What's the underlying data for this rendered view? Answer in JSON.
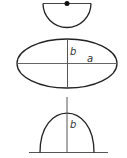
{
  "diagram": {
    "shapes": [
      {
        "name": "semicircle",
        "description": "half circle with diameter line and center point"
      },
      {
        "name": "ellipse",
        "labels": {
          "semi_minor": "b",
          "semi_major": "a"
        }
      },
      {
        "name": "parabolic-arch",
        "labels": {
          "height": "b"
        }
      }
    ],
    "colors": {
      "stroke": "#222222",
      "axis": "#555555",
      "background": "#ffffff"
    }
  },
  "labels": {
    "ellipse_b": "b",
    "ellipse_a": "a",
    "arch_b": "b"
  }
}
